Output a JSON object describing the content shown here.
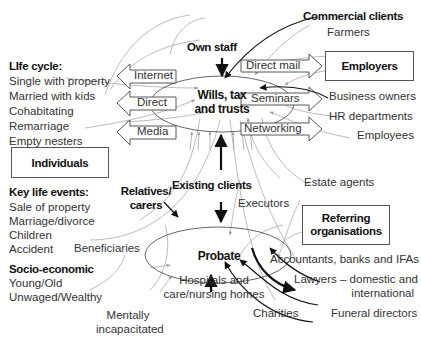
{
  "diagram": {
    "hubs": {
      "wills": "Wills, tax and trusts",
      "wills_line1": "Wills, tax",
      "wills_line2": "and trusts",
      "probate": "Probate"
    },
    "connectors": {
      "own_staff": "Own staff",
      "existing_clients": "Existing clients",
      "relatives_line1": "Relatives/",
      "relatives_line2": "carers"
    },
    "channels_left": [
      "Internet",
      "Direct",
      "Media"
    ],
    "channels_right": [
      "Direct mail",
      "Seminars",
      "Networking"
    ],
    "boxes": {
      "individuals": "Individuals",
      "employers": "Employers",
      "referring_line1": "Referring",
      "referring_line2": "organisations"
    },
    "commercial": {
      "heading": "Commercial clients",
      "items": [
        "Farmers",
        "Business owners",
        "HR departments",
        "Employees"
      ]
    },
    "life_cycle": {
      "heading": "LIfe cycle:",
      "items": [
        "Single with property",
        "Married with kids",
        "Cohabitating",
        "Remarriage",
        "Empty nesters"
      ]
    },
    "key_life_events": {
      "heading": "Key life events:",
      "items": [
        "Sale of property",
        "Marriage/divorce",
        "Children",
        "Accident"
      ]
    },
    "socio_economic": {
      "heading": "Socio-economic",
      "items": [
        "Young/Old",
        "Unwaged/Wealthy"
      ]
    },
    "probate_sources": {
      "executors": "Executors",
      "estate_agents": "Estate agents",
      "beneficiaries": "Beneficiaries",
      "hospitals_line1": "Hospitals and",
      "hospitals_line2": "care/nursing homes",
      "mentally_line1": "Mentally",
      "mentally_line2": "incapacitated",
      "charities": "Charities",
      "accountants": "Accountants, banks and IFAs",
      "lawyers_line1": "Lawyers – domestic and",
      "lawyers_line2": "international",
      "funeral": "Funeral directors"
    }
  }
}
